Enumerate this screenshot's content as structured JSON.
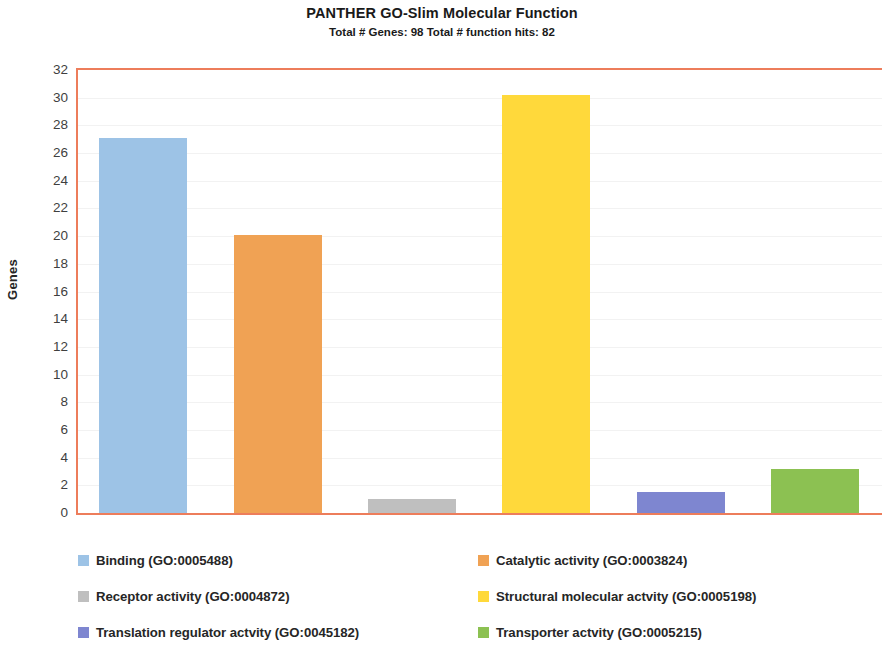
{
  "chart_data": {
    "type": "bar",
    "title": "PANTHER GO-Slim Molecular Function",
    "subtitle": "Total # Genes: 98 Total # function hits: 82",
    "xlabel": "",
    "ylabel": "Genes",
    "ylim": [
      0,
      32
    ],
    "ytick_step": 2,
    "yticks": [
      "32",
      "30",
      "28",
      "26",
      "24",
      "22",
      "20",
      "18",
      "16",
      "14",
      "12",
      "10",
      "8",
      "6",
      "4",
      "2",
      "0"
    ],
    "grid": true,
    "legend_position": "bottom",
    "categories": [
      "Binding (GO:0005488)",
      "Catalytic activity (GO:0003824)",
      "Receptor activity (GO:0004872)",
      "Structural molecular actvity (GO:0005198)",
      "Translation regulator actvity (GO:0045182)",
      "Transporter actvity (GO:0005215)"
    ],
    "values": [
      27.1,
      20.1,
      1.0,
      30.2,
      1.5,
      3.2
    ],
    "colors": [
      "#9DC3E6",
      "#F0A254",
      "#BFBFBF",
      "#FFD93B",
      "#7E86D0",
      "#8CC152"
    ],
    "axis_color": "#ED7D5B",
    "gridline_color": "#F2F2F2"
  },
  "legend": {
    "entries": [
      {
        "label": "Binding (GO:0005488)",
        "color": "#9DC3E6"
      },
      {
        "label": "Catalytic activity (GO:0003824)",
        "color": "#F0A254"
      },
      {
        "label": "Receptor activity (GO:0004872)",
        "color": "#BFBFBF"
      },
      {
        "label": "Structural molecular actvity (GO:0005198)",
        "color": "#FFD93B"
      },
      {
        "label": "Translation regulator actvity (GO:0045182)",
        "color": "#7E86D0"
      },
      {
        "label": "Transporter actvity (GO:0005215)",
        "color": "#8CC152"
      }
    ]
  }
}
